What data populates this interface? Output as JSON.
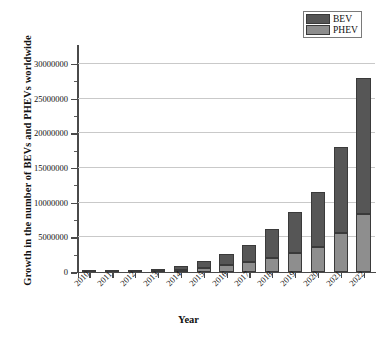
{
  "chart_data": {
    "type": "bar",
    "subtype": "stacked-vertical",
    "title": "",
    "xlabel": "Year",
    "ylabel": "Growth in the number of BEVs and PHEVs worldwide",
    "categories": [
      "2010",
      "2011",
      "2012",
      "2013",
      "2014",
      "2015",
      "2016",
      "2017",
      "2018",
      "2019",
      "2020",
      "2021",
      "2022"
    ],
    "series": [
      {
        "name": "PHEV",
        "color": "#8e8e8e",
        "values": [
          0,
          10000,
          60000,
          170000,
          330000,
          580000,
          950000,
          1450000,
          2000000,
          2700000,
          3650000,
          5600000,
          8300000
        ]
      },
      {
        "name": "BEV",
        "color": "#565656",
        "values": [
          20000,
          50000,
          120000,
          290000,
          500000,
          940000,
          1600000,
          2450000,
          4200000,
          6000000,
          7850000,
          12400000,
          19700000
        ]
      }
    ],
    "totals": [
      20000,
      60000,
      180000,
      460000,
      830000,
      1520000,
      2550000,
      3900000,
      6200000,
      8700000,
      11500000,
      18000000,
      28000000
    ],
    "ylim": [
      0,
      31000000
    ],
    "ytick_labels": [
      "0",
      "5000000",
      "10000000",
      "15000000",
      "20000000",
      "25000000",
      "30000000"
    ],
    "ytick_values": [
      0,
      5000000,
      10000000,
      15000000,
      20000000,
      25000000,
      30000000
    ],
    "yminor_step": 2500000,
    "grid": "horizontal",
    "legend_position": "top-right",
    "legend_entries": [
      "BEV",
      "PHEV"
    ],
    "xtick_label_rotation": -45,
    "axis_color": "#4a4a4a",
    "grid_color": "#c9c9c9"
  }
}
